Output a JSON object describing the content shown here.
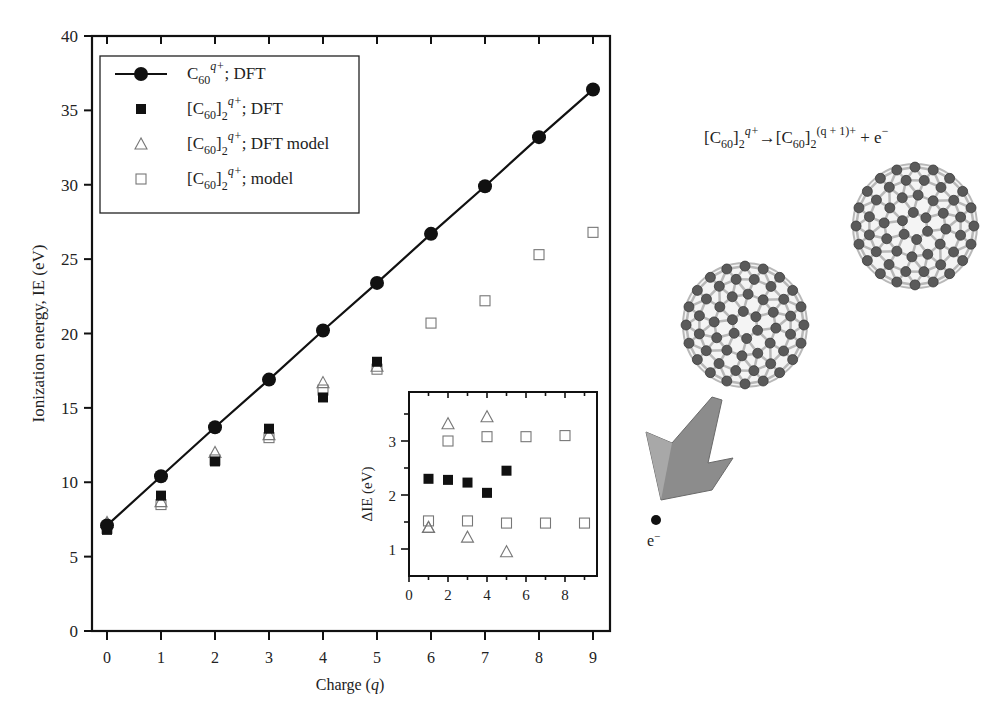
{
  "chart_data": [
    {
      "type": "scatter",
      "title": "",
      "xlabel": "Charge (q)",
      "ylabel": "Ionization energy, IE (eV)",
      "xlim": [
        -0.2,
        9.3
      ],
      "ylim": [
        0,
        40
      ],
      "x_ticks": [
        0,
        1,
        2,
        3,
        4,
        5,
        6,
        7,
        8,
        9
      ],
      "y_ticks": [
        0,
        5,
        10,
        15,
        20,
        25,
        30,
        35,
        40
      ],
      "grid": false,
      "legend_position": "upper left",
      "series": [
        {
          "name": "C60 q+; DFT",
          "marker": "filled-circle",
          "line": true,
          "x": [
            0,
            1,
            2,
            3,
            4,
            5,
            6,
            7,
            8,
            9
          ],
          "values": [
            7.1,
            10.4,
            13.7,
            16.9,
            20.2,
            23.4,
            26.7,
            29.9,
            33.2,
            36.4
          ]
        },
        {
          "name": "[C60]2 q+; DFT",
          "marker": "filled-square",
          "line": false,
          "x": [
            0,
            1,
            2,
            3,
            4,
            5
          ],
          "values": [
            6.8,
            9.1,
            11.4,
            13.6,
            15.7,
            18.1
          ]
        },
        {
          "name": "[C60]2 q+; DFT model",
          "marker": "open-triangle",
          "line": false,
          "x": [
            0,
            1,
            2,
            3,
            4,
            5
          ],
          "values": [
            7.3,
            8.7,
            12.0,
            13.2,
            16.7,
            17.8
          ]
        },
        {
          "name": "[C60]2 q+; model",
          "marker": "open-square",
          "line": false,
          "x": [
            0,
            1,
            2,
            3,
            4,
            5,
            6,
            7,
            8,
            9
          ],
          "values": [
            6.9,
            8.5,
            11.5,
            13.0,
            16.2,
            17.6,
            20.7,
            22.2,
            25.3,
            26.8
          ]
        }
      ]
    },
    {
      "type": "scatter",
      "title": "inset",
      "xlabel": "",
      "ylabel": "ΔIE (eV)",
      "xlim": [
        0,
        9.6
      ],
      "ylim": [
        0.5,
        3.9
      ],
      "x_ticks": [
        0,
        2,
        4,
        6,
        8
      ],
      "y_ticks": [
        1,
        2,
        3
      ],
      "grid": false,
      "series": [
        {
          "name": "[C60]2 q+; DFT",
          "marker": "filled-square",
          "x": [
            1,
            2,
            3,
            4,
            5
          ],
          "values": [
            2.3,
            2.28,
            2.23,
            2.04,
            2.45
          ]
        },
        {
          "name": "[C60]2 q+; DFT model",
          "marker": "open-triangle",
          "x": [
            1,
            2,
            3,
            4,
            5,
            1
          ],
          "values": [
            1.4,
            3.32,
            1.22,
            3.45,
            0.95,
            1.4
          ]
        },
        {
          "name": "[C60]2 q+; model",
          "marker": "open-square",
          "x": [
            1,
            2,
            3,
            4,
            5,
            6,
            7,
            8,
            9
          ],
          "values": [
            1.52,
            3.0,
            1.52,
            3.08,
            1.48,
            3.08,
            1.48,
            3.1,
            1.48
          ]
        }
      ]
    }
  ],
  "legend": {
    "items": [
      {
        "base": "C",
        "sub": "60",
        "sup": "q+",
        "tail": "; DFT"
      },
      {
        "base": "[C",
        "sub": "60",
        "mid": "]",
        "sub2": "2",
        "sup": "q+",
        "tail": "; DFT"
      },
      {
        "base": "[C",
        "sub": "60",
        "mid": "]",
        "sub2": "2",
        "sup": "q+",
        "tail": "; DFT model"
      },
      {
        "base": "[C",
        "sub": "60",
        "mid": "]",
        "sub2": "2",
        "sup": "q+",
        "tail": "; model"
      }
    ]
  },
  "axes": {
    "ylabel": "Ionization energy, IE (eV)",
    "xlabel_main": "Charge (",
    "xlabel_var": "q",
    "xlabel_end": ")",
    "inset_ylabel": "ΔIE (eV)"
  },
  "illustration": {
    "reaction": {
      "lhs_base": "[C",
      "lhs_sub": "60",
      "lhs_mid": "]",
      "lhs_sub2": "2",
      "lhs_sup": "q+",
      "arrow": "→",
      "rhs_base": "[C",
      "rhs_sub": "60",
      "rhs_mid": "]",
      "rhs_sub2": "2",
      "rhs_sup": "(q + 1)+",
      "plus": " + e",
      "electron_sup": "−"
    },
    "electron_label": "e",
    "electron_label_sup": "−",
    "colors": {
      "fullerene": "#5a5a5a",
      "bond": "#b8b8b8",
      "arrow": "#8c8c8c"
    }
  }
}
